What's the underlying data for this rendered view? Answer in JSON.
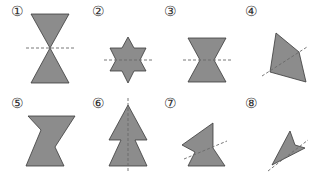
{
  "figures": [
    {
      "label": "①",
      "lx": 11,
      "ly": 16,
      "points": "31,14 69,14 50,48 69,83 31,83 50,48",
      "axis": [
        26,
        48,
        74,
        48
      ]
    },
    {
      "label": "②",
      "lx": 92,
      "ly": 16,
      "points": "128,37 134,48 146,48 140,60 146,71 134,71 128,83 122,71 110,71 116,60 110,48 122,48",
      "axis": [
        104,
        60,
        152,
        60
      ]
    },
    {
      "label": "③",
      "lx": 164,
      "ly": 16,
      "points": "188,38 226,38 214,60 226,82 188,82 200,60",
      "axis": [
        183,
        60,
        231,
        60
      ]
    },
    {
      "label": "④",
      "lx": 245,
      "ly": 16,
      "points": "276,33 299,52 306,82 270,72",
      "axis": [
        262,
        76,
        307,
        47
      ]
    },
    {
      "label": "⑤",
      "lx": 11,
      "ly": 108,
      "points": "28,116 75,116 55,147 64,166 26,166 41,130",
      "axis": null
    },
    {
      "label": "⑥",
      "lx": 92,
      "ly": 108,
      "points": "128,105 147,140 135,140 147,166 109,166 121,140 109,140",
      "axis": [
        128,
        98,
        128,
        173
      ]
    },
    {
      "label": "⑦",
      "lx": 164,
      "ly": 108,
      "points": "213,123 213,148 225,166 188,166 195,152 182,145",
      "axis": [
        184,
        159,
        227,
        141
      ]
    },
    {
      "label": "⑧",
      "lx": 245,
      "ly": 108,
      "points": "290,131 295,145 305,148 272,165",
      "axis": [
        268,
        171,
        308,
        140
      ]
    }
  ]
}
